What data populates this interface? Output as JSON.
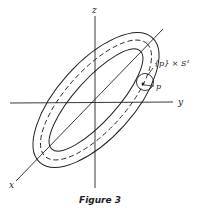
{
  "figure": {
    "caption": "Figure 3",
    "axes": {
      "x_label": "x",
      "y_label": "y",
      "z_label": "z"
    },
    "annotations": {
      "circle_label": "{p} × S¹",
      "point_label": "p"
    },
    "colors": {
      "stroke": "#222222",
      "background": "#ffffff"
    }
  }
}
